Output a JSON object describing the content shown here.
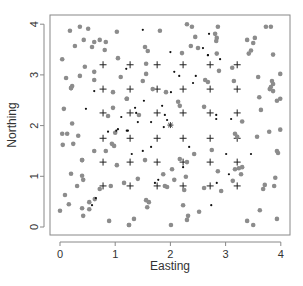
{
  "chart_data": {
    "type": "scatter",
    "title": "",
    "xlabel": "Easting",
    "ylabel": "Northing",
    "xlim": [
      -0.18,
      4.17
    ],
    "ylim": [
      -0.18,
      4.18
    ],
    "x_ticks": [
      0,
      1,
      2,
      3,
      4
    ],
    "y_ticks": [
      0,
      1,
      2,
      3,
      4
    ],
    "x_tick_labels": [
      "0",
      "1",
      "2",
      "3",
      "4"
    ],
    "y_tick_labels": [
      "0",
      "1",
      "2",
      "3",
      "4"
    ],
    "grid": false,
    "legend": null,
    "series": [
      {
        "name": "sample grid",
        "marker": "plus",
        "color": "#222222",
        "points": [
          [
            0.78,
            3.2
          ],
          [
            1.27,
            3.2
          ],
          [
            1.76,
            3.2
          ],
          [
            2.23,
            3.2
          ],
          [
            2.72,
            3.2
          ],
          [
            3.21,
            3.2
          ],
          [
            0.78,
            2.72
          ],
          [
            1.27,
            2.72
          ],
          [
            1.76,
            2.72
          ],
          [
            2.23,
            2.72
          ],
          [
            2.72,
            2.72
          ],
          [
            3.21,
            2.72
          ],
          [
            0.78,
            2.25
          ],
          [
            1.27,
            2.25
          ],
          [
            1.76,
            2.25
          ],
          [
            2.23,
            2.25
          ],
          [
            2.72,
            2.25
          ],
          [
            3.21,
            2.25
          ],
          [
            0.78,
            1.75
          ],
          [
            1.27,
            1.75
          ],
          [
            1.76,
            1.75
          ],
          [
            2.23,
            1.75
          ],
          [
            2.72,
            1.75
          ],
          [
            3.21,
            1.75
          ],
          [
            0.78,
            1.28
          ],
          [
            1.27,
            1.28
          ],
          [
            1.76,
            1.28
          ],
          [
            2.23,
            1.28
          ],
          [
            2.72,
            1.28
          ],
          [
            3.21,
            1.28
          ],
          [
            0.78,
            0.81
          ],
          [
            1.27,
            0.81
          ],
          [
            1.76,
            0.81
          ],
          [
            2.23,
            0.81
          ],
          [
            2.72,
            0.81
          ],
          [
            3.21,
            0.81
          ]
        ]
      },
      {
        "name": "grey points",
        "marker": "circle",
        "color": "#8c8c8c",
        "points": [
          [
            0.18,
            3.87
          ],
          [
            0.36,
            3.95
          ],
          [
            0.51,
            3.91
          ],
          [
            1.03,
            3.85
          ],
          [
            0.27,
            3.57
          ],
          [
            0.43,
            3.69
          ],
          [
            0.62,
            3.65
          ],
          [
            0.72,
            3.69
          ],
          [
            0.83,
            3.65
          ],
          [
            0.58,
            3.55
          ],
          [
            0.81,
            3.49
          ],
          [
            0.04,
            3.31
          ],
          [
            1.05,
            3.33
          ],
          [
            0.45,
            3.16
          ],
          [
            0.62,
            3.06
          ],
          [
            0.11,
            2.94
          ],
          [
            0.36,
            2.98
          ],
          [
            0.62,
            2.9
          ],
          [
            1.1,
            2.96
          ],
          [
            0.22,
            2.78
          ],
          [
            0.2,
            2.74
          ],
          [
            1.81,
            3.87
          ],
          [
            2.3,
            4.0
          ],
          [
            2.39,
            3.95
          ],
          [
            2.45,
            3.75
          ],
          [
            1.54,
            3.55
          ],
          [
            1.59,
            3.47
          ],
          [
            2.21,
            3.43
          ],
          [
            2.37,
            3.57
          ],
          [
            2.5,
            3.53
          ],
          [
            1.56,
            3.22
          ],
          [
            1.56,
            3.02
          ],
          [
            1.5,
            2.88
          ],
          [
            2.63,
            2.9
          ],
          [
            2.68,
            2.86
          ],
          [
            2.86,
            3.95
          ],
          [
            2.81,
            3.81
          ],
          [
            2.84,
            3.73
          ],
          [
            2.83,
            3.67
          ],
          [
            3.73,
            3.95
          ],
          [
            3.82,
            3.95
          ],
          [
            3.39,
            3.69
          ],
          [
            3.53,
            3.73
          ],
          [
            3.5,
            3.63
          ],
          [
            3.46,
            3.48
          ],
          [
            3.42,
            3.42
          ],
          [
            3.86,
            3.4
          ],
          [
            2.84,
            3.42
          ],
          [
            2.88,
            3.08
          ],
          [
            3.12,
            3.14
          ],
          [
            3.15,
            2.88
          ],
          [
            3.59,
            2.96
          ],
          [
            3.99,
            3.02
          ],
          [
            3.84,
            2.88
          ],
          [
            3.86,
            2.82
          ],
          [
            3.82,
            2.76
          ],
          [
            0.2,
            2.74
          ],
          [
            0.96,
            2.66
          ],
          [
            0.07,
            2.33
          ],
          [
            0.96,
            2.35
          ],
          [
            0.87,
            2.19
          ],
          [
            1.21,
            2.53
          ],
          [
            0.22,
            2.04
          ],
          [
            0.04,
            1.84
          ],
          [
            0.13,
            1.84
          ],
          [
            0.33,
            1.8
          ],
          [
            1.0,
            1.86
          ],
          [
            0.05,
            1.62
          ],
          [
            0.24,
            1.64
          ],
          [
            0.94,
            1.64
          ],
          [
            0.98,
            1.6
          ],
          [
            0.62,
            1.5
          ],
          [
            0.83,
            1.5
          ],
          [
            0.4,
            1.32
          ],
          [
            1.68,
            2.72
          ],
          [
            1.92,
            2.66
          ],
          [
            1.21,
            2.53
          ],
          [
            2.14,
            2.47
          ],
          [
            2.17,
            2.39
          ],
          [
            1.43,
            2.21
          ],
          [
            2.61,
            2.37
          ],
          [
            2.43,
            1.44
          ],
          [
            3.8,
            2.72
          ],
          [
            3.86,
            2.68
          ],
          [
            3.61,
            2.56
          ],
          [
            3.93,
            2.49
          ],
          [
            3.99,
            2.53
          ],
          [
            3.64,
            2.31
          ],
          [
            3.3,
            2.08
          ],
          [
            3.57,
            1.78
          ],
          [
            3.79,
            1.88
          ],
          [
            3.99,
            1.92
          ],
          [
            3.17,
            1.84
          ],
          [
            3.21,
            1.78
          ],
          [
            2.75,
            1.52
          ],
          [
            3.93,
            1.5
          ],
          [
            3.95,
            1.46
          ],
          [
            0.4,
            1.32
          ],
          [
            1.03,
            1.22
          ],
          [
            0.2,
            1.05
          ],
          [
            0.4,
            1.01
          ],
          [
            0.42,
            0.93
          ],
          [
            0.31,
            0.81
          ],
          [
            0.72,
            0.75
          ],
          [
            0.92,
            0.81
          ],
          [
            1.16,
            0.87
          ],
          [
            0.09,
            0.63
          ],
          [
            0.16,
            0.45
          ],
          [
            0.63,
            0.55
          ],
          [
            0.53,
            0.49
          ],
          [
            0.4,
            0.37
          ],
          [
            0.53,
            0.35
          ],
          [
            0.0,
            0.32
          ],
          [
            0.42,
            0.22
          ],
          [
            0.89,
            0.12
          ],
          [
            1.25,
            0.04
          ],
          [
            1.54,
            1.32
          ],
          [
            2.17,
            1.34
          ],
          [
            2.3,
            1.28
          ],
          [
            2.03,
            1.14
          ],
          [
            1.87,
            1.04
          ],
          [
            2.07,
            0.93
          ],
          [
            2.28,
            0.99
          ],
          [
            1.41,
            0.95
          ],
          [
            1.9,
            0.81
          ],
          [
            1.94,
            0.79
          ],
          [
            2.25,
            0.73
          ],
          [
            2.61,
            0.77
          ],
          [
            1.56,
            0.53
          ],
          [
            1.61,
            0.49
          ],
          [
            1.58,
            0.39
          ],
          [
            2.23,
            0.43
          ],
          [
            2.52,
            0.3
          ],
          [
            2.32,
            0.22
          ],
          [
            2.3,
            0.14
          ],
          [
            1.34,
            0.16
          ],
          [
            1.25,
            0.04
          ],
          [
            2.01,
            0.04
          ],
          [
            2.86,
            1.1
          ],
          [
            3.17,
            1.14
          ],
          [
            3.24,
            1.16
          ],
          [
            3.3,
            1.18
          ],
          [
            3.28,
            1.04
          ],
          [
            3.13,
            0.91
          ],
          [
            2.92,
            0.71
          ],
          [
            3.71,
            0.83
          ],
          [
            3.68,
            0.75
          ],
          [
            3.88,
            0.81
          ],
          [
            3.9,
            0.97
          ],
          [
            3.62,
            0.33
          ],
          [
            3.93,
            0.16
          ],
          [
            3.39,
            0.12
          ],
          [
            3.5,
            0.04
          ]
        ]
      },
      {
        "name": "black points",
        "marker": "dot",
        "color": "#111111",
        "points": [
          [
            1.2,
            3.12
          ],
          [
            1.5,
            3.89
          ],
          [
            2.0,
            3.45
          ],
          [
            2.59,
            3.53
          ],
          [
            2.7,
            3.81
          ],
          [
            2.68,
            3.39
          ],
          [
            2.07,
            3.06
          ],
          [
            2.16,
            2.98
          ],
          [
            2.46,
            2.98
          ],
          [
            2.41,
            2.84
          ],
          [
            2.68,
            3.39
          ],
          [
            2.9,
            3.31
          ],
          [
            0.62,
            2.68
          ],
          [
            0.47,
            2.33
          ],
          [
            1.11,
            2.17
          ],
          [
            0.87,
            1.88
          ],
          [
            1.05,
            1.93
          ],
          [
            1.21,
            1.9
          ],
          [
            1.02,
            1.9
          ],
          [
            2.01,
            2.66
          ],
          [
            1.52,
            2.49
          ],
          [
            1.36,
            2.35
          ],
          [
            1.38,
            2.25
          ],
          [
            1.85,
            2.39
          ],
          [
            1.9,
            2.21
          ],
          [
            1.94,
            2.11
          ],
          [
            1.41,
            2.07
          ],
          [
            1.65,
            2.07
          ],
          [
            1.88,
            1.97
          ],
          [
            1.23,
            1.9
          ],
          [
            2.34,
            1.58
          ],
          [
            1.65,
            1.58
          ],
          [
            1.5,
            1.5
          ],
          [
            1.3,
            1.44
          ],
          [
            2.83,
            2.21
          ],
          [
            2.83,
            2.13
          ],
          [
            3.1,
            2.13
          ],
          [
            3.01,
            1.44
          ],
          [
            3.46,
            1.44
          ],
          [
            0.65,
            0.57
          ],
          [
            0.58,
            0.43
          ],
          [
            2.23,
            1.18
          ],
          [
            1.78,
            0.93
          ],
          [
            1.72,
            0.87
          ],
          [
            3.06,
            1.04
          ],
          [
            2.84,
            0.87
          ],
          [
            2.74,
            0.43
          ]
        ]
      },
      {
        "name": "star",
        "marker": "star",
        "color": "#333333",
        "points": [
          [
            2.0,
            2.01
          ]
        ]
      }
    ]
  }
}
